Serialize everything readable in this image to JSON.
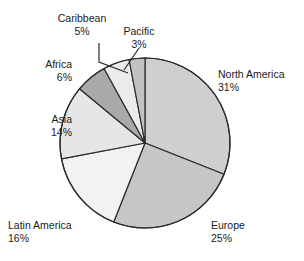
{
  "chart_data": {
    "type": "pie",
    "title": "",
    "subtitle": "",
    "xlabel": "",
    "ylabel": "",
    "legend_position": "none",
    "grid": false,
    "start_angle_deg": 0,
    "direction": "clockwise",
    "value_unit": "percent",
    "categories": [
      "North America",
      "Europe",
      "Latin America",
      "Asia",
      "Africa",
      "Caribbean",
      "Pacific"
    ],
    "values": [
      31,
      25,
      16,
      14,
      6,
      5,
      3
    ],
    "slices": [
      {
        "label": "North America",
        "value": 31,
        "value_text": "31%",
        "color": "#cfcfcf"
      },
      {
        "label": "Europe",
        "value": 25,
        "value_text": "25%",
        "color": "#c6c6c6"
      },
      {
        "label": "Latin America",
        "value": 16,
        "value_text": "16%",
        "color": "#f2f2f2"
      },
      {
        "label": "Asia",
        "value": 14,
        "value_text": "14%",
        "color": "#e6e6e6"
      },
      {
        "label": "Africa",
        "value": 6,
        "value_text": "6%",
        "color": "#a9a9a9"
      },
      {
        "label": "Caribbean",
        "value": 5,
        "value_text": "5%",
        "color": "#ebebeb"
      },
      {
        "label": "Pacific",
        "value": 3,
        "value_text": "3%",
        "color": "#c2c2c2"
      }
    ],
    "stroke_color": "#2b2b2b",
    "background_color": "#ffffff",
    "leader_lines": [
      "Caribbean",
      "Pacific"
    ]
  },
  "labels": {
    "north_america": {
      "name": "North America",
      "pct": "31%"
    },
    "europe": {
      "name": "Europe",
      "pct": "25%"
    },
    "latin_america": {
      "name": "Latin America",
      "pct": "16%"
    },
    "asia": {
      "name": "Asia",
      "pct": "14%"
    },
    "africa": {
      "name": "Africa",
      "pct": "6%"
    },
    "caribbean": {
      "name": "Caribbean",
      "pct": "5%"
    },
    "pacific": {
      "name": "Pacific",
      "pct": "3%"
    }
  }
}
